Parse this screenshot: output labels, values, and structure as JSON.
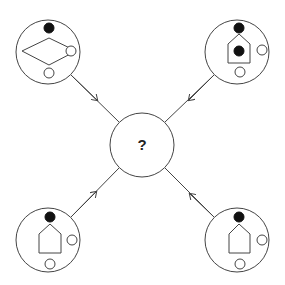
{
  "diagram": {
    "type": "logic-puzzle-completion",
    "center": {
      "label": "?",
      "cx": 142,
      "cy": 145,
      "r": 32
    },
    "colors": {
      "stroke": "#444444",
      "fill_black": "#111111",
      "background": "#ffffff"
    },
    "nodes": [
      {
        "id": "top-left",
        "cx": 48,
        "cy": 52,
        "r": 32,
        "outer_shape": "diamond",
        "elements": [
          {
            "kind": "black-dot",
            "position": "top, outside shape"
          },
          {
            "kind": "diamond",
            "position": "center"
          },
          {
            "kind": "white-dot",
            "position": "on right vertex of diamond"
          },
          {
            "kind": "white-dot",
            "position": "bottom"
          }
        ],
        "arrow_direction": "toward center"
      },
      {
        "id": "top-right",
        "cx": 237,
        "cy": 52,
        "r": 32,
        "outer_shape": "house-pentagon",
        "elements": [
          {
            "kind": "black-dot",
            "position": "top, above roof"
          },
          {
            "kind": "house-pentagon",
            "position": "center"
          },
          {
            "kind": "black-dot",
            "position": "inside house"
          },
          {
            "kind": "white-dot",
            "position": "right"
          },
          {
            "kind": "white-dot",
            "position": "bottom"
          }
        ],
        "arrow_direction": "toward center"
      },
      {
        "id": "bottom-left",
        "cx": 48,
        "cy": 240,
        "r": 32,
        "outer_shape": "house-pentagon",
        "elements": [
          {
            "kind": "black-dot",
            "position": "top, touching roof apex"
          },
          {
            "kind": "house-pentagon",
            "position": "center"
          },
          {
            "kind": "white-dot",
            "position": "right"
          },
          {
            "kind": "white-dot",
            "position": "bottom"
          }
        ],
        "arrow_direction": "toward center"
      },
      {
        "id": "bottom-right",
        "cx": 237,
        "cy": 240,
        "r": 32,
        "outer_shape": "house-pentagon",
        "elements": [
          {
            "kind": "black-dot",
            "position": "top, touching roof apex"
          },
          {
            "kind": "house-pentagon",
            "position": "center"
          },
          {
            "kind": "white-dot",
            "position": "right"
          },
          {
            "kind": "white-dot",
            "position": "bottom"
          }
        ],
        "arrow_direction": "toward center"
      }
    ]
  }
}
